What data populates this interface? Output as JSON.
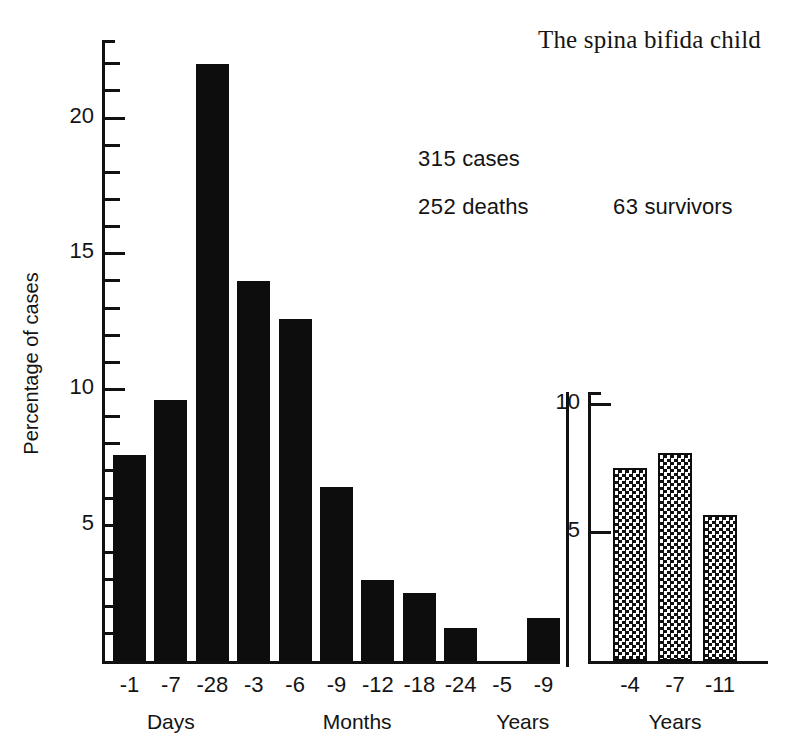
{
  "title": "The spina bifida child",
  "annotations": {
    "cases_number": "315",
    "cases_word": "cases",
    "deaths_number": "252",
    "deaths_word": "deaths",
    "survivors_number": "63",
    "survivors_word": "survivors"
  },
  "axes": {
    "ylabel": "Percentage of cases",
    "y_tick_labels": [
      "5",
      "10",
      "15",
      "20"
    ],
    "surv_y_tick_labels": [
      "5",
      "10"
    ]
  },
  "chart_data": {
    "type": "bar",
    "title": "The spina bifida child",
    "xlabel": "",
    "ylabel": "Percentage of cases",
    "ylim": [
      0,
      22.8
    ],
    "grid": false,
    "legend": "none",
    "panels": [
      {
        "name": "deaths",
        "fill": "solid-black",
        "ylim": [
          0,
          22.8
        ],
        "y_ticks_major": [
          5,
          10,
          15,
          20
        ],
        "y_ticks_minor_step": 1,
        "categories": [
          "-1",
          "-7",
          "-28",
          "-3",
          "-6",
          "-9",
          "-12",
          "-18",
          "-24",
          "-5",
          "-9"
        ],
        "values": [
          7.6,
          9.6,
          22.0,
          14.0,
          12.6,
          6.4,
          3.0,
          2.5,
          1.2,
          0.0,
          1.6
        ],
        "group_labels": [
          {
            "label": "Days",
            "categories": [
              "-1",
              "-7",
              "-28"
            ]
          },
          {
            "label": "Months",
            "categories": [
              "-3",
              "-6",
              "-9",
              "-12",
              "-18",
              "-24"
            ]
          },
          {
            "label": "Years",
            "categories": [
              "-5",
              "-9"
            ]
          }
        ]
      },
      {
        "name": "survivors",
        "fill": "checkerboard",
        "ylim": [
          0,
          10.4
        ],
        "y_ticks_major": [
          5,
          10
        ],
        "categories": [
          "-4",
          "-7",
          "-11"
        ],
        "values": [
          7.5,
          8.1,
          5.7
        ],
        "group_labels": [
          {
            "label": "Years",
            "categories": [
              "-4",
              "-7",
              "-11"
            ]
          }
        ]
      }
    ]
  },
  "main_ticks": [
    {
      "value": "5",
      "label": "5"
    },
    {
      "value": "10",
      "label": "10"
    },
    {
      "value": "15",
      "label": "15"
    },
    {
      "value": "20",
      "label": "20"
    }
  ],
  "main_bars": [
    {
      "cat": "-1",
      "value": 7.6
    },
    {
      "cat": "-7",
      "value": 9.6
    },
    {
      "cat": "-28",
      "value": 22.0
    },
    {
      "cat": "-3",
      "value": 14.0
    },
    {
      "cat": "-6",
      "value": 12.6
    },
    {
      "cat": "-9",
      "value": 6.4
    },
    {
      "cat": "-12",
      "value": 3.0
    },
    {
      "cat": "-18",
      "value": 2.5
    },
    {
      "cat": "-24",
      "value": 1.2
    },
    {
      "cat": "-5",
      "value": 0.0
    },
    {
      "cat": "-9",
      "value": 1.6
    }
  ],
  "main_groups": [
    {
      "label": "Days"
    },
    {
      "label": "Months"
    },
    {
      "label": "Years"
    }
  ],
  "surv_bars": [
    {
      "cat": "-4",
      "value": 7.5
    },
    {
      "cat": "-7",
      "value": 8.1
    },
    {
      "cat": "-11",
      "value": 5.7
    }
  ],
  "surv_group": {
    "label": "Years"
  },
  "colors": {
    "ink": "#111111",
    "paper": "#ffffff"
  }
}
